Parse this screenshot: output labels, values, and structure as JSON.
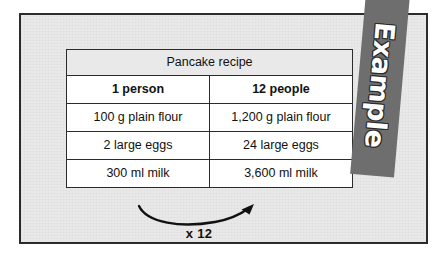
{
  "banner": {
    "label": "Example"
  },
  "table": {
    "title": "Pancake recipe",
    "columns": [
      "1 person",
      "12 people"
    ],
    "rows": [
      [
        "100 g plain flour",
        "1,200 g plain flour"
      ],
      [
        "2 large eggs",
        "24 large eggs"
      ],
      [
        "300 ml milk",
        "3,600 ml milk"
      ]
    ]
  },
  "annotation": {
    "multiplier": "x 12",
    "arrow": "curved-arrow-left-to-right"
  },
  "colors": {
    "page_background": "#ffffff",
    "panel_background": "#e9e9e9",
    "border": "#2b2b2b",
    "cell_background": "#ffffff",
    "ribbon_background": "#6e6e6e",
    "ribbon_text": "#ffffff",
    "text": "#111111"
  }
}
